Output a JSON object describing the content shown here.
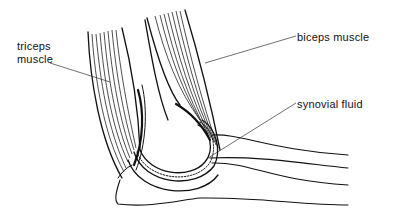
{
  "diagram": {
    "labels": [
      {
        "id": "triceps",
        "line1": "triceps",
        "line2": "muscle"
      },
      {
        "id": "biceps",
        "text": "biceps muscle"
      },
      {
        "id": "synovial",
        "text": "synovial fluid"
      }
    ],
    "colors": {
      "ink": "#111111",
      "background": "#ffffff"
    }
  }
}
